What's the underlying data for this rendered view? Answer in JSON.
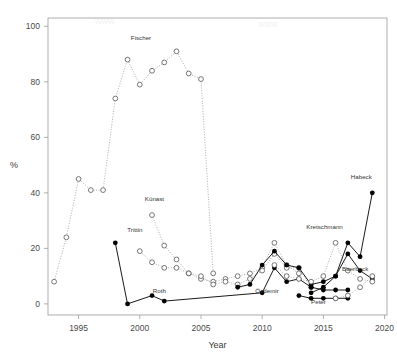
{
  "chart_data": {
    "type": "scatter",
    "title": "",
    "xlabel": "Year",
    "ylabel": "%",
    "xlim": [
      1992.5,
      2020.2
    ],
    "ylim": [
      -4,
      103
    ],
    "xticks": [
      1995,
      2000,
      2005,
      2010,
      2015,
      2020
    ],
    "yticks": [
      0,
      20,
      40,
      60,
      80,
      100
    ],
    "grid": false,
    "legend": "none",
    "marker_styles": {
      "open_circle": "hollow circle, dotted connector",
      "filled_circle": "solid black circle, solid connector",
      "square": "hollow square marker"
    },
    "series": [
      {
        "name": "Fischer",
        "marker": "open_circle",
        "connector": "dotted",
        "label_x": 2000.1,
        "label_y": 95,
        "points": [
          {
            "x": 1993,
            "y": 8
          },
          {
            "x": 1994,
            "y": 24
          },
          {
            "x": 1995,
            "y": 45
          },
          {
            "x": 1996,
            "y": 41
          },
          {
            "x": 1997,
            "y": 41
          },
          {
            "x": 1998,
            "y": 74
          },
          {
            "x": 1999,
            "y": 88
          },
          {
            "x": 2000,
            "y": 79
          },
          {
            "x": 2001,
            "y": 84
          },
          {
            "x": 2002,
            "y": 87
          },
          {
            "x": 2003,
            "y": 91
          },
          {
            "x": 2004,
            "y": 83
          },
          {
            "x": 2005,
            "y": 81
          },
          {
            "x": 2006,
            "y": 11
          }
        ]
      },
      {
        "name": "Künast",
        "marker": "open_circle",
        "connector": "dotted",
        "label_x": 2001.2,
        "label_y": 37,
        "points": [
          {
            "x": 2001,
            "y": 32
          },
          {
            "x": 2002,
            "y": 21
          },
          {
            "x": 2003,
            "y": 16
          },
          {
            "x": 2004,
            "y": 11
          },
          {
            "x": 2005,
            "y": 9
          },
          {
            "x": 2006,
            "y": 8
          },
          {
            "x": 2007,
            "y": 9
          },
          {
            "x": 2008,
            "y": 10
          },
          {
            "x": 2009,
            "y": 11
          },
          {
            "x": 2010,
            "y": 13
          },
          {
            "x": 2011,
            "y": 22
          },
          {
            "x": 2012,
            "y": 14
          },
          {
            "x": 2013,
            "y": 11
          }
        ]
      },
      {
        "name": "Trittin",
        "marker": "open_circle",
        "connector": "dotted",
        "label_x": 1999.6,
        "label_y": 26,
        "points": [
          {
            "x": 2000,
            "y": 19
          },
          {
            "x": 2001,
            "y": 15
          },
          {
            "x": 2002,
            "y": 13
          },
          {
            "x": 2003,
            "y": 13
          },
          {
            "x": 2004,
            "y": 11
          },
          {
            "x": 2005,
            "y": 10
          },
          {
            "x": 2006,
            "y": 7
          },
          {
            "x": 2007,
            "y": 8
          },
          {
            "x": 2008,
            "y": 7
          },
          {
            "x": 2009,
            "y": 9
          },
          {
            "x": 2010,
            "y": 12
          },
          {
            "x": 2011,
            "y": 18
          },
          {
            "x": 2012,
            "y": 13
          },
          {
            "x": 2013,
            "y": 13
          },
          {
            "x": 2014,
            "y": 6
          }
        ]
      },
      {
        "name": "Roth",
        "marker": "filled_circle",
        "connector": "solid",
        "label_x": 2001.6,
        "label_y": 4,
        "points": [
          {
            "x": 1998,
            "y": 22
          },
          {
            "x": 1999,
            "y": 0
          },
          {
            "x": 2001,
            "y": 3
          },
          {
            "x": 2002,
            "y": 1
          },
          {
            "x": 2010,
            "y": 4
          },
          {
            "x": 2011,
            "y": 13
          },
          {
            "x": 2012,
            "y": 8
          },
          {
            "x": 2013,
            "y": 9
          },
          {
            "x": 2014,
            "y": 6
          },
          {
            "x": 2015,
            "y": 5
          },
          {
            "x": 2016,
            "y": 5
          },
          {
            "x": 2017,
            "y": 5
          }
        ]
      },
      {
        "name": "Özdemir",
        "marker": "filled_circle",
        "connector": "solid",
        "label_x": 2010.4,
        "label_y": 4,
        "points": [
          {
            "x": 2008,
            "y": 6
          },
          {
            "x": 2009,
            "y": 7
          },
          {
            "x": 2010,
            "y": 14
          },
          {
            "x": 2011,
            "y": 19
          },
          {
            "x": 2012,
            "y": 14
          },
          {
            "x": 2013,
            "y": 13
          },
          {
            "x": 2014,
            "y": 7
          },
          {
            "x": 2015,
            "y": 8
          },
          {
            "x": 2016,
            "y": 10
          },
          {
            "x": 2017,
            "y": 18
          },
          {
            "x": 2018,
            "y": 12
          },
          {
            "x": 2019,
            "y": 9
          }
        ]
      },
      {
        "name": "Kretschmann",
        "marker": "open_circle",
        "connector": "dotted",
        "label_x": 2015.1,
        "label_y": 27,
        "points": [
          {
            "x": 2011,
            "y": 14
          },
          {
            "x": 2012,
            "y": 10
          },
          {
            "x": 2013,
            "y": 9
          },
          {
            "x": 2014,
            "y": 8
          },
          {
            "x": 2015,
            "y": 10
          },
          {
            "x": 2016,
            "y": 22
          },
          {
            "x": 2017,
            "y": 12
          },
          {
            "x": 2018,
            "y": 9
          },
          {
            "x": 2019,
            "y": 8
          }
        ]
      },
      {
        "name": "Peter",
        "marker": "filled_circle",
        "connector": "solid",
        "label_x": 2014.6,
        "label_y": 0,
        "points": [
          {
            "x": 2013,
            "y": 3
          },
          {
            "x": 2014,
            "y": 2
          },
          {
            "x": 2015,
            "y": 2
          },
          {
            "x": 2016,
            "y": 2
          },
          {
            "x": 2017,
            "y": 2
          }
        ]
      },
      {
        "name": "Habeck",
        "marker": "filled_circle",
        "connector": "solid",
        "label_x": 2018.1,
        "label_y": 45,
        "points": [
          {
            "x": 2014,
            "y": 4
          },
          {
            "x": 2015,
            "y": 6
          },
          {
            "x": 2016,
            "y": 10
          },
          {
            "x": 2017,
            "y": 22
          },
          {
            "x": 2018,
            "y": 17
          },
          {
            "x": 2019,
            "y": 40
          }
        ]
      },
      {
        "name": "Baerbock",
        "marker": "open_circle",
        "connector": "dotted",
        "label_x": 2017.6,
        "label_y": 12,
        "points": [
          {
            "x": 2016,
            "y": 2
          },
          {
            "x": 2017,
            "y": 3
          },
          {
            "x": 2018,
            "y": 6
          },
          {
            "x": 2019,
            "y": 10
          }
        ]
      }
    ],
    "annotations": [
      {
        "text": "Fischer",
        "x": 2000.1,
        "y": 95
      },
      {
        "text": "Künast",
        "x": 2001.2,
        "y": 37
      },
      {
        "text": "Trittin",
        "x": 1999.6,
        "y": 26
      },
      {
        "text": "Roth",
        "x": 2001.6,
        "y": 4
      },
      {
        "text": "Özdemir",
        "x": 2010.4,
        "y": 4
      },
      {
        "text": "Kretschmann",
        "x": 2015.1,
        "y": 27
      },
      {
        "text": "Peter",
        "x": 2014.6,
        "y": 0
      },
      {
        "text": "Habeck",
        "x": 2018.1,
        "y": 45
      },
      {
        "text": "Baerbock",
        "x": 2017.6,
        "y": 12
      }
    ]
  },
  "axes": {
    "x_tick_labels": [
      "1995",
      "2000",
      "2005",
      "2010",
      "2015",
      "2020"
    ],
    "y_tick_labels": [
      "0",
      "20",
      "40",
      "60",
      "80",
      "100"
    ],
    "x_axis_title": "Year",
    "y_axis_title": "%"
  },
  "colors": {
    "background": "#ffffff",
    "axis": "#9a9a9a",
    "marker_open": "#555555",
    "marker_filled": "#000000",
    "text": "#3a3a3a"
  }
}
